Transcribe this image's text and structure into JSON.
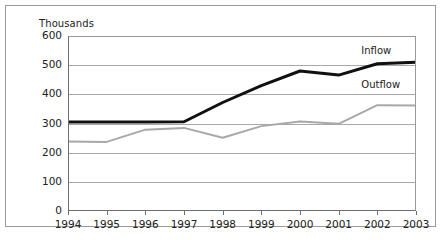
{
  "figure": {
    "units_label": "Thousands",
    "caption": ""
  },
  "chart_data": {
    "type": "line",
    "title": "",
    "subtitle": "",
    "xlabel": "",
    "ylabel": "Thousands",
    "categories": [
      "1994",
      "1995",
      "1996",
      "1997",
      "1998",
      "1999",
      "2000",
      "2001",
      "2002",
      "2003"
    ],
    "x": [
      1994,
      1995,
      1996,
      1997,
      1998,
      1999,
      2000,
      2001,
      2002,
      2003
    ],
    "ylim": [
      0,
      600
    ],
    "xlim": [
      1994,
      2003
    ],
    "yticks": [
      0,
      100,
      200,
      300,
      400,
      500,
      600
    ],
    "ytick_labels": [
      "0",
      "100",
      "200",
      "300",
      "400",
      "500",
      "600"
    ],
    "grid": true,
    "grid_axis": "y",
    "legend_position": "inline-right",
    "series": [
      {
        "name": "Inflow",
        "color": "#101010",
        "width": 3,
        "values": [
          305,
          305,
          305,
          306,
          372,
          430,
          480,
          466,
          505,
          510
        ]
      },
      {
        "name": "Outflow",
        "color": "#a8a8a8",
        "width": 2,
        "values": [
          238,
          237,
          279,
          285,
          251,
          291,
          307,
          299,
          363,
          362
        ]
      }
    ],
    "annotations": [
      {
        "text": "Inflow",
        "series": "Inflow",
        "x": 2002,
        "y": 545
      },
      {
        "text": "Outflow",
        "series": "Outflow",
        "x": 2002,
        "y": 430
      }
    ]
  }
}
